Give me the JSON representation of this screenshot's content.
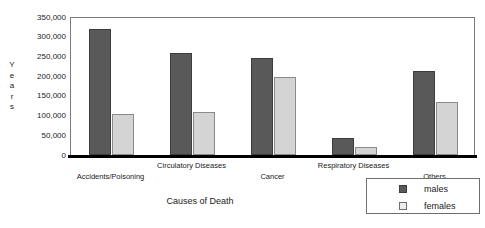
{
  "chart_data": {
    "type": "bar",
    "title": "",
    "xlabel": "Causes of Death",
    "ylabel": "Years",
    "categories": [
      "Accidents/Poisoning",
      "Circulatory Diseases",
      "Cancer",
      "Respiratory Diseases",
      "Others"
    ],
    "series": [
      {
        "name": "males",
        "color": "#595959",
        "values": [
          320000,
          260000,
          245000,
          43000,
          213000
        ]
      },
      {
        "name": "females",
        "color": "#d4d4d4",
        "values": [
          105000,
          110000,
          198000,
          20000,
          135000
        ]
      }
    ],
    "ylim": [
      0,
      350000
    ],
    "ytick_values": [
      350000,
      300000,
      250000,
      200000,
      150000,
      100000,
      50000,
      0
    ],
    "ytick_labels": [
      "350,000",
      "300,000",
      "250,000",
      "200,000",
      "150,000",
      "100,000",
      "50,000",
      "0"
    ],
    "grid": false,
    "legend_position": "bottom-right",
    "legend_entries": [
      "males",
      "females"
    ]
  },
  "axes": {
    "y_title_stacked": "Y\ne\na\nr\ns",
    "x_title": "Causes of Death"
  },
  "legend": {
    "items": [
      {
        "label": "males"
      },
      {
        "label": "females"
      }
    ]
  }
}
